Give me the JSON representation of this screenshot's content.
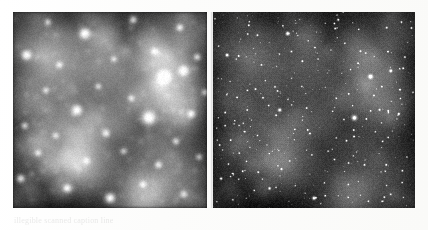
{
  "figure": {
    "background_color": "#ffffff",
    "width": 428,
    "height": 230,
    "caption_text": "illegible scanned caption line"
  },
  "panels": [
    {
      "id": "left",
      "name": "seeing-limited-image",
      "label": "",
      "x": 13,
      "y": 12,
      "width": 194,
      "height": 196,
      "background_color": "#1a1a1a",
      "sky_level": 0.22,
      "psf_blur_px": 3.2,
      "resolution": "low",
      "faint_star_visibility": 0.25,
      "description": "blurred star field, broad overlapping point spread functions"
    },
    {
      "id": "right",
      "name": "adaptive-optics-image",
      "label": "",
      "x": 213,
      "y": 12,
      "width": 202,
      "height": 196,
      "background_color": "#0d0d0d",
      "sky_level": 0.12,
      "psf_blur_px": 0.7,
      "resolution": "high",
      "faint_star_visibility": 1.0,
      "description": "sharp star field, many resolved faint point sources"
    }
  ],
  "chart_data": {
    "type": "scatter",
    "title": "",
    "xlabel": "",
    "ylabel": "",
    "xlim": [
      0,
      100
    ],
    "ylim": [
      0,
      100
    ],
    "grid": false,
    "legend": "none",
    "note": "Two renderings of the same dense stellar field. Coordinates are percent of panel box; r is relative source radius; b is relative brightness 0-1.",
    "bright_stars": [
      {
        "x": 37,
        "y": 11,
        "r": 5.6,
        "b": 1.0
      },
      {
        "x": 62,
        "y": 4,
        "r": 3.0,
        "b": 0.8
      },
      {
        "x": 86,
        "y": 8,
        "r": 2.6,
        "b": 0.76
      },
      {
        "x": 7,
        "y": 22,
        "r": 4.6,
        "b": 0.94
      },
      {
        "x": 24,
        "y": 27,
        "r": 2.2,
        "b": 0.66
      },
      {
        "x": 52,
        "y": 24,
        "r": 2.0,
        "b": 0.62
      },
      {
        "x": 73,
        "y": 20,
        "r": 2.4,
        "b": 0.7
      },
      {
        "x": 95,
        "y": 23,
        "r": 2.6,
        "b": 0.72
      },
      {
        "x": 78,
        "y": 33,
        "r": 6.8,
        "b": 1.0
      },
      {
        "x": 88,
        "y": 30,
        "r": 4.2,
        "b": 0.92
      },
      {
        "x": 17,
        "y": 40,
        "r": 2.2,
        "b": 0.64
      },
      {
        "x": 44,
        "y": 38,
        "r": 2.0,
        "b": 0.6
      },
      {
        "x": 61,
        "y": 44,
        "r": 2.2,
        "b": 0.66
      },
      {
        "x": 33,
        "y": 50,
        "r": 5.0,
        "b": 0.98
      },
      {
        "x": 70,
        "y": 54,
        "r": 8.2,
        "b": 1.0
      },
      {
        "x": 92,
        "y": 52,
        "r": 3.0,
        "b": 0.82
      },
      {
        "x": 6,
        "y": 58,
        "r": 2.4,
        "b": 0.68
      },
      {
        "x": 22,
        "y": 63,
        "r": 2.0,
        "b": 0.6
      },
      {
        "x": 48,
        "y": 62,
        "r": 2.6,
        "b": 0.74
      },
      {
        "x": 84,
        "y": 66,
        "r": 2.4,
        "b": 0.7
      },
      {
        "x": 13,
        "y": 72,
        "r": 2.2,
        "b": 0.64
      },
      {
        "x": 38,
        "y": 76,
        "r": 2.0,
        "b": 0.58
      },
      {
        "x": 57,
        "y": 71,
        "r": 2.2,
        "b": 0.62
      },
      {
        "x": 75,
        "y": 78,
        "r": 2.6,
        "b": 0.72
      },
      {
        "x": 96,
        "y": 74,
        "r": 2.2,
        "b": 0.64
      },
      {
        "x": 4,
        "y": 85,
        "r": 3.6,
        "b": 0.88
      },
      {
        "x": 28,
        "y": 90,
        "r": 3.4,
        "b": 0.86
      },
      {
        "x": 50,
        "y": 95,
        "r": 5.2,
        "b": 0.96
      },
      {
        "x": 67,
        "y": 88,
        "r": 2.2,
        "b": 0.64
      },
      {
        "x": 88,
        "y": 93,
        "r": 2.4,
        "b": 0.68
      },
      {
        "x": 18,
        "y": 5,
        "r": 2.0,
        "b": 0.58
      },
      {
        "x": 99,
        "y": 41,
        "r": 2.2,
        "b": 0.62
      }
    ],
    "faint_star_count": 420,
    "faint_star_seed": 20240716
  }
}
